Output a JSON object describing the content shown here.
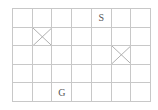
{
  "grid": {
    "rows": 5,
    "cols": 7,
    "line_color": "#c8c8c8",
    "text_color": "#555555",
    "cells": [
      {
        "row": 0,
        "col": 4,
        "type": "label",
        "text": "S",
        "meaning": "start"
      },
      {
        "row": 4,
        "col": 2,
        "type": "label",
        "text": "G",
        "meaning": "goal"
      },
      {
        "row": 1,
        "col": 1,
        "type": "blocked"
      },
      {
        "row": 2,
        "col": 5,
        "type": "blocked"
      }
    ]
  }
}
